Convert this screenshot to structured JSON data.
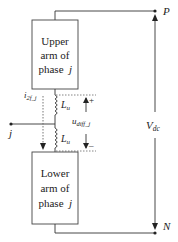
{
  "diagram": {
    "upper_arm": {
      "line1": "Upper",
      "line2": "arm of",
      "line3": "phase",
      "var": "j"
    },
    "lower_arm": {
      "line1": "Lower",
      "line2": "arm of",
      "line3": "phase",
      "var": "j"
    },
    "nodes": {
      "top": "P",
      "bottom": "N",
      "mid": "j"
    },
    "inductor_upper": {
      "label": "L",
      "sub": "u"
    },
    "inductor_lower": {
      "label": "L",
      "sub": "u"
    },
    "current": {
      "label": "i",
      "sub": "2f_j"
    },
    "voltage_diff": {
      "label": "u",
      "sub": "diff_j",
      "plus": "+",
      "minus": "–"
    },
    "vdc": {
      "label": "V",
      "sub": "dc"
    },
    "colors": {
      "line": "#333333",
      "dotted": "#666666"
    }
  }
}
